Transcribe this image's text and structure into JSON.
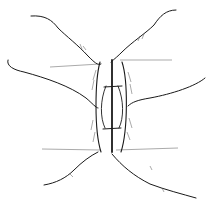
{
  "illustration": {
    "subject": "line drawing of fingers pressing tissue around a vertical sutured incision",
    "colors": {
      "background": "#ffffff",
      "ink": "#1a1a1a"
    }
  }
}
